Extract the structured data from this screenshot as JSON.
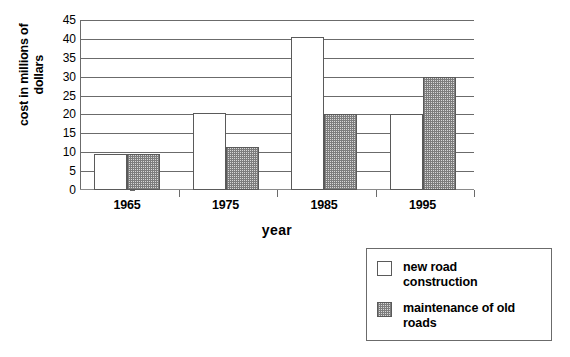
{
  "chart_data": {
    "type": "bar",
    "title": "",
    "xlabel": "year",
    "ylabel": "cost in millions of\ndollars",
    "categories": [
      "1965",
      "1975",
      "1985",
      "1995"
    ],
    "series": [
      {
        "name": "new road construction",
        "values": [
          9.5,
          20.5,
          40.5,
          20
        ]
      },
      {
        "name": "maintenance of old roads",
        "values": [
          9.5,
          11.5,
          20,
          30
        ]
      }
    ],
    "ylim": [
      0,
      45
    ],
    "ytick_step": 5,
    "yticks": [
      0,
      5,
      10,
      15,
      20,
      25,
      30,
      35,
      40,
      45
    ],
    "ytick_labels": [
      "0",
      "5",
      "10",
      "15",
      "20",
      "25",
      "30",
      "35",
      "40",
      "45"
    ],
    "grid": true,
    "grid_axis": "y",
    "legend_position": "bottom-right",
    "legend_entries": [
      {
        "label": "new road\nconstruction",
        "swatch": "white"
      },
      {
        "label": "maintenance of old\nroads",
        "swatch": "gray-checker"
      }
    ],
    "colors": {
      "new_road": "#ffffff",
      "maintenance": "#d8d8d8",
      "axis": "#6b6b6b",
      "bar_border": "#5a5a5a",
      "background": "#ffffff"
    }
  },
  "axes": {
    "y_title": "cost in millions of\ndollars",
    "x_title": "year"
  },
  "legend": {
    "new_road_label": "new road\nconstruction",
    "maintenance_label": "maintenance of old\nroads"
  }
}
